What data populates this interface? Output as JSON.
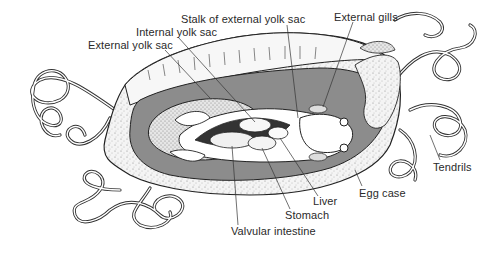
{
  "figure": {
    "colors": {
      "background": "#ffffff",
      "line": "#222222",
      "egg_case_fill": "#f2f2f2",
      "cavity_fill": "#8c8c8c",
      "embryo_fill": "#ffffff",
      "yolk_fill": "#ececec"
    },
    "labels": {
      "stalk_external_yolk_sac": "Stalk of external yolk sac",
      "internal_yolk_sac": "Internal yolk sac",
      "external_yolk_sac": "External yolk sac",
      "external_gills": "External gills",
      "tendrils": "Tendrils",
      "egg_case": "Egg case",
      "liver": "Liver",
      "stomach": "Stomach",
      "valvular_intestine": "Valvular intestine"
    }
  }
}
